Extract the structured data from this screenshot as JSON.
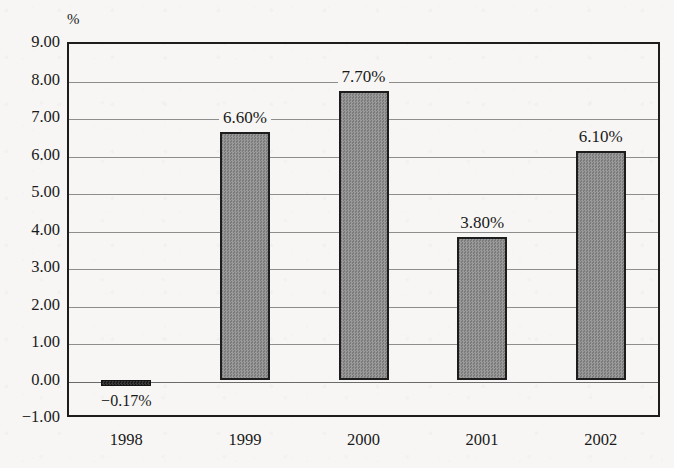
{
  "chart_data": {
    "type": "bar",
    "title": "",
    "subtitle": "",
    "xlabel": "",
    "ylabel": "",
    "unit_label": "%",
    "categories": [
      "1998",
      "1999",
      "2000",
      "2001",
      "2002"
    ],
    "values": [
      -0.17,
      6.6,
      7.7,
      3.8,
      6.1
    ],
    "data_labels": [
      "−0.17%",
      "6.60%",
      "7.70%",
      "3.80%",
      "6.10%"
    ],
    "ylim": [
      -1.0,
      9.0
    ],
    "ytick_values": [
      9.0,
      8.0,
      7.0,
      6.0,
      5.0,
      4.0,
      3.0,
      2.0,
      1.0,
      0.0,
      -1.0
    ],
    "ytick_labels": [
      "9.00",
      "8.00",
      "7.00",
      "6.00",
      "5.00",
      "4.00",
      "3.00",
      "2.00",
      "1.00",
      "0.00",
      "−1.00"
    ],
    "grid": true,
    "legend": "none",
    "series": [
      {
        "name": "",
        "values": [
          -0.17,
          6.6,
          7.7,
          3.8,
          6.1
        ]
      }
    ]
  },
  "style": {
    "bar_fill": "#8a8a8a",
    "bar_border": "#1d1d1d",
    "negative_bar_fill": "#2a2a2a",
    "gridline_color": "#8d8d8d",
    "frame_color": "#1d1d1d",
    "background": "#f7f6f4",
    "text_color": "#1a1a1a"
  }
}
